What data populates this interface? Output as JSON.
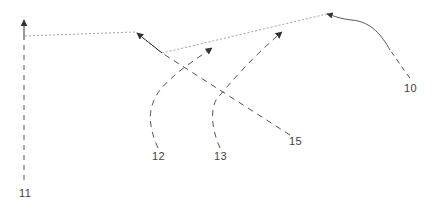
{
  "diagram": {
    "labels": [
      {
        "id": "10",
        "text": "10",
        "x": 404,
        "y": 82
      },
      {
        "id": "11",
        "text": "11",
        "x": 19,
        "y": 187
      },
      {
        "id": "12",
        "text": "12",
        "x": 152,
        "y": 150
      },
      {
        "id": "13",
        "text": "13",
        "x": 214,
        "y": 150
      },
      {
        "id": "15",
        "text": "15",
        "x": 289,
        "y": 135
      }
    ],
    "colors": {
      "stroke": "#555555",
      "dotted": "#888888"
    }
  }
}
